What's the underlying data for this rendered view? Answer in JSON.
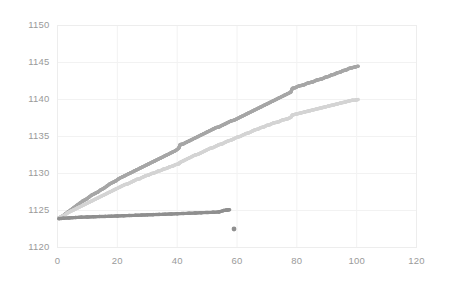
{
  "chart_data": {
    "type": "scatter",
    "title": "",
    "xlabel": "",
    "ylabel": "",
    "xlim": [
      0,
      120
    ],
    "ylim": [
      1120,
      1150
    ],
    "xticks": [
      0,
      20,
      40,
      60,
      80,
      100,
      120
    ],
    "yticks": [
      1120,
      1125,
      1130,
      1135,
      1140,
      1145,
      1150
    ],
    "grid": true,
    "legend": "none",
    "series": [
      {
        "name": "upper-rising-series",
        "color": "#a6a6a6",
        "marker": "dot",
        "points": [
          [
            0.5,
            1124.0
          ],
          [
            1.5,
            1124.2
          ],
          [
            2.5,
            1124.5
          ],
          [
            3.5,
            1124.8
          ],
          [
            4.5,
            1125.1
          ],
          [
            5.5,
            1125.4
          ],
          [
            6.5,
            1125.7
          ],
          [
            7.5,
            1126.0
          ],
          [
            8.5,
            1126.3
          ],
          [
            9.5,
            1126.5
          ],
          [
            10.5,
            1126.8
          ],
          [
            11.5,
            1127.1
          ],
          [
            12.5,
            1127.3
          ],
          [
            13.5,
            1127.5
          ],
          [
            14.5,
            1127.8
          ],
          [
            15.5,
            1128.0
          ],
          [
            16.5,
            1128.3
          ],
          [
            17.5,
            1128.6
          ],
          [
            18.5,
            1128.8
          ],
          [
            19.5,
            1129.0
          ],
          [
            20.5,
            1129.3
          ],
          [
            21.5,
            1129.5
          ],
          [
            22.5,
            1129.7
          ],
          [
            23.5,
            1129.9
          ],
          [
            24.5,
            1130.1
          ],
          [
            25.5,
            1130.3
          ],
          [
            26.5,
            1130.5
          ],
          [
            27.5,
            1130.7
          ],
          [
            28.5,
            1130.9
          ],
          [
            29.5,
            1131.1
          ],
          [
            30.5,
            1131.3
          ],
          [
            31.5,
            1131.5
          ],
          [
            32.5,
            1131.7
          ],
          [
            33.5,
            1131.9
          ],
          [
            34.5,
            1132.1
          ],
          [
            35.5,
            1132.3
          ],
          [
            36.5,
            1132.5
          ],
          [
            37.5,
            1132.7
          ],
          [
            38.5,
            1132.9
          ],
          [
            39.5,
            1133.1
          ],
          [
            40.5,
            1133.4
          ],
          [
            41.0,
            1133.9
          ],
          [
            42.0,
            1134.0
          ],
          [
            43.0,
            1134.2
          ],
          [
            44.0,
            1134.4
          ],
          [
            45.0,
            1134.6
          ],
          [
            46.0,
            1134.8
          ],
          [
            47.0,
            1135.0
          ],
          [
            48.0,
            1135.2
          ],
          [
            49.0,
            1135.4
          ],
          [
            50.0,
            1135.6
          ],
          [
            51.0,
            1135.8
          ],
          [
            52.0,
            1136.0
          ],
          [
            53.0,
            1136.2
          ],
          [
            54.0,
            1136.3
          ],
          [
            55.0,
            1136.5
          ],
          [
            56.0,
            1136.7
          ],
          [
            57.0,
            1136.9
          ],
          [
            58.0,
            1137.1
          ],
          [
            59.0,
            1137.2
          ],
          [
            60.0,
            1137.4
          ],
          [
            61.0,
            1137.6
          ],
          [
            62.0,
            1137.8
          ],
          [
            63.0,
            1138.0
          ],
          [
            64.0,
            1138.2
          ],
          [
            65.0,
            1138.4
          ],
          [
            66.0,
            1138.6
          ],
          [
            67.0,
            1138.8
          ],
          [
            68.0,
            1139.0
          ],
          [
            69.0,
            1139.2
          ],
          [
            70.0,
            1139.4
          ],
          [
            71.0,
            1139.6
          ],
          [
            72.0,
            1139.8
          ],
          [
            73.0,
            1140.0
          ],
          [
            74.0,
            1140.2
          ],
          [
            75.0,
            1140.4
          ],
          [
            76.0,
            1140.6
          ],
          [
            77.0,
            1140.8
          ],
          [
            78.0,
            1141.0
          ],
          [
            78.5,
            1141.5
          ],
          [
            79.5,
            1141.6
          ],
          [
            80.5,
            1141.8
          ],
          [
            81.5,
            1141.9
          ],
          [
            82.5,
            1142.0
          ],
          [
            83.5,
            1142.2
          ],
          [
            84.5,
            1142.3
          ],
          [
            85.5,
            1142.4
          ],
          [
            86.5,
            1142.6
          ],
          [
            87.5,
            1142.7
          ],
          [
            88.5,
            1142.8
          ],
          [
            89.5,
            1143.0
          ],
          [
            90.5,
            1143.1
          ],
          [
            91.5,
            1143.3
          ],
          [
            92.5,
            1143.4
          ],
          [
            93.5,
            1143.6
          ],
          [
            94.5,
            1143.7
          ],
          [
            95.5,
            1143.9
          ],
          [
            96.5,
            1144.0
          ],
          [
            97.5,
            1144.2
          ],
          [
            98.5,
            1144.3
          ],
          [
            99.5,
            1144.4
          ],
          [
            100.5,
            1144.5
          ]
        ]
      },
      {
        "name": "lower-rising-series",
        "color": "#d4d4d4",
        "marker": "dot",
        "points": [
          [
            0.5,
            1124.0
          ],
          [
            1.5,
            1124.2
          ],
          [
            2.5,
            1124.4
          ],
          [
            3.5,
            1124.7
          ],
          [
            4.5,
            1124.9
          ],
          [
            5.5,
            1125.1
          ],
          [
            6.5,
            1125.3
          ],
          [
            7.5,
            1125.5
          ],
          [
            8.5,
            1125.7
          ],
          [
            9.5,
            1125.9
          ],
          [
            10.5,
            1126.1
          ],
          [
            11.5,
            1126.3
          ],
          [
            12.5,
            1126.5
          ],
          [
            13.5,
            1126.7
          ],
          [
            14.5,
            1126.9
          ],
          [
            15.5,
            1127.1
          ],
          [
            16.5,
            1127.3
          ],
          [
            17.5,
            1127.5
          ],
          [
            18.5,
            1127.7
          ],
          [
            19.5,
            1127.9
          ],
          [
            20.5,
            1128.1
          ],
          [
            21.5,
            1128.3
          ],
          [
            22.5,
            1128.5
          ],
          [
            23.5,
            1128.6
          ],
          [
            24.5,
            1128.8
          ],
          [
            25.5,
            1129.0
          ],
          [
            26.5,
            1129.2
          ],
          [
            27.5,
            1129.3
          ],
          [
            28.5,
            1129.5
          ],
          [
            29.5,
            1129.7
          ],
          [
            30.5,
            1129.8
          ],
          [
            31.5,
            1130.0
          ],
          [
            32.5,
            1130.1
          ],
          [
            33.5,
            1130.3
          ],
          [
            34.5,
            1130.4
          ],
          [
            35.5,
            1130.6
          ],
          [
            36.5,
            1130.7
          ],
          [
            37.5,
            1130.9
          ],
          [
            38.5,
            1131.0
          ],
          [
            39.5,
            1131.2
          ],
          [
            40.5,
            1131.3
          ],
          [
            41.0,
            1131.5
          ],
          [
            42.0,
            1131.7
          ],
          [
            43.0,
            1131.9
          ],
          [
            44.0,
            1132.1
          ],
          [
            45.0,
            1132.3
          ],
          [
            46.0,
            1132.5
          ],
          [
            47.0,
            1132.6
          ],
          [
            48.0,
            1132.8
          ],
          [
            49.0,
            1133.0
          ],
          [
            50.0,
            1133.2
          ],
          [
            51.0,
            1133.4
          ],
          [
            52.0,
            1133.5
          ],
          [
            53.0,
            1133.7
          ],
          [
            54.0,
            1133.9
          ],
          [
            55.0,
            1134.0
          ],
          [
            56.0,
            1134.2
          ],
          [
            57.0,
            1134.4
          ],
          [
            58.0,
            1134.5
          ],
          [
            59.0,
            1134.7
          ],
          [
            60.0,
            1134.9
          ],
          [
            61.0,
            1135.0
          ],
          [
            62.0,
            1135.2
          ],
          [
            63.0,
            1135.4
          ],
          [
            64.0,
            1135.5
          ],
          [
            65.0,
            1135.7
          ],
          [
            66.0,
            1135.9
          ],
          [
            67.0,
            1136.0
          ],
          [
            68.0,
            1136.2
          ],
          [
            69.0,
            1136.3
          ],
          [
            70.0,
            1136.5
          ],
          [
            71.0,
            1136.6
          ],
          [
            72.0,
            1136.8
          ],
          [
            73.0,
            1136.9
          ],
          [
            74.0,
            1137.0
          ],
          [
            75.0,
            1137.2
          ],
          [
            76.0,
            1137.3
          ],
          [
            77.0,
            1137.4
          ],
          [
            78.0,
            1137.6
          ],
          [
            78.5,
            1137.9
          ],
          [
            79.5,
            1138.0
          ],
          [
            80.5,
            1138.1
          ],
          [
            81.5,
            1138.2
          ],
          [
            82.5,
            1138.3
          ],
          [
            83.5,
            1138.4
          ],
          [
            84.5,
            1138.5
          ],
          [
            85.5,
            1138.6
          ],
          [
            86.5,
            1138.7
          ],
          [
            87.5,
            1138.8
          ],
          [
            88.5,
            1138.9
          ],
          [
            89.5,
            1139.0
          ],
          [
            90.5,
            1139.1
          ],
          [
            91.5,
            1139.2
          ],
          [
            92.5,
            1139.3
          ],
          [
            93.5,
            1139.4
          ],
          [
            94.5,
            1139.5
          ],
          [
            95.5,
            1139.6
          ],
          [
            96.5,
            1139.7
          ],
          [
            97.5,
            1139.8
          ],
          [
            98.5,
            1139.9
          ],
          [
            99.5,
            1139.9
          ],
          [
            100.5,
            1140.0
          ]
        ]
      },
      {
        "name": "flat-series",
        "color": "#8f8f8f",
        "marker": "dot",
        "points": [
          [
            0.5,
            1123.9
          ],
          [
            2.0,
            1123.95
          ],
          [
            4.0,
            1124.0
          ],
          [
            6.0,
            1124.05
          ],
          [
            8.0,
            1124.1
          ],
          [
            10.0,
            1124.12
          ],
          [
            12.0,
            1124.15
          ],
          [
            14.0,
            1124.18
          ],
          [
            16.0,
            1124.2
          ],
          [
            18.0,
            1124.23
          ],
          [
            20.0,
            1124.26
          ],
          [
            22.0,
            1124.29
          ],
          [
            24.0,
            1124.32
          ],
          [
            26.0,
            1124.35
          ],
          [
            28.0,
            1124.38
          ],
          [
            30.0,
            1124.41
          ],
          [
            32.0,
            1124.44
          ],
          [
            34.0,
            1124.47
          ],
          [
            36.0,
            1124.5
          ],
          [
            38.0,
            1124.53
          ],
          [
            40.0,
            1124.56
          ],
          [
            42.0,
            1124.6
          ],
          [
            44.0,
            1124.63
          ],
          [
            46.0,
            1124.66
          ],
          [
            48.0,
            1124.7
          ],
          [
            50.0,
            1124.73
          ],
          [
            52.0,
            1124.76
          ],
          [
            54.0,
            1124.8
          ],
          [
            55.5,
            1125.0
          ],
          [
            56.5,
            1125.05
          ],
          [
            57.5,
            1125.1
          ]
        ]
      },
      {
        "name": "outlier-point-series",
        "color": "#8f8f8f",
        "marker": "dot",
        "points": [
          [
            59.0,
            1122.5
          ]
        ]
      }
    ]
  },
  "axes": {
    "y_tick_labels": [
      "1150",
      "1145",
      "1140",
      "1135",
      "1130",
      "1125",
      "1120"
    ],
    "x_tick_labels": [
      "0",
      "20",
      "40",
      "60",
      "80",
      "100",
      "120"
    ]
  },
  "style": {
    "grid_color": "#f2f2f2",
    "axis_line_color": "#ededed",
    "tick_text_color": "#9a9a9a",
    "background": "#ffffff"
  }
}
